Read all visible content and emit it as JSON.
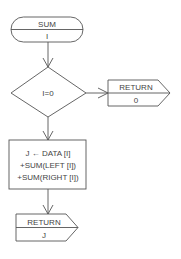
{
  "diagram": {
    "type": "flowchart",
    "colors": {
      "stroke": "#555555",
      "text": "#444444",
      "background": "#ffffff"
    },
    "nodes": {
      "start": {
        "shape": "terminator",
        "title": "SUM",
        "param": "I"
      },
      "decision": {
        "shape": "diamond",
        "condition": "I=0"
      },
      "return_zero": {
        "shape": "return",
        "title": "RETURN",
        "value": "0"
      },
      "process": {
        "shape": "process",
        "lines": [
          "J ← DATA [I]",
          "+SUM(LEFT [I])",
          "+SUM(RIGHT [I])"
        ]
      },
      "return_j": {
        "shape": "return",
        "title": "RETURN",
        "value": "J"
      }
    },
    "edges": [
      {
        "from": "start",
        "to": "decision"
      },
      {
        "from": "decision",
        "to": "return_zero",
        "direction": "right"
      },
      {
        "from": "decision",
        "to": "process",
        "direction": "down"
      },
      {
        "from": "process",
        "to": "return_j"
      }
    ]
  }
}
